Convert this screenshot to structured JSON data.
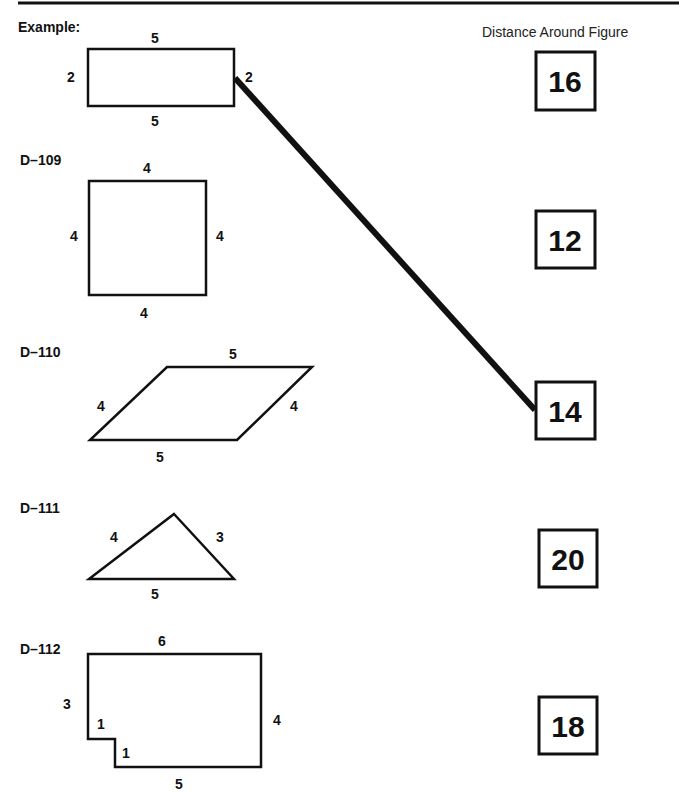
{
  "header": {
    "column_title": "Distance Around Figure"
  },
  "example": {
    "label": "Example:",
    "sides": {
      "top": "5",
      "bottom": "5",
      "left": "2",
      "right": "2"
    }
  },
  "problems": [
    {
      "id": "D–109",
      "shape": "square",
      "sides": {
        "top": "4",
        "bottom": "4",
        "left": "4",
        "right": "4"
      }
    },
    {
      "id": "D–110",
      "shape": "parallelogram",
      "sides": {
        "top": "5",
        "bottom": "5",
        "left": "4",
        "right": "4"
      }
    },
    {
      "id": "D–111",
      "shape": "triangle",
      "sides": {
        "left": "4",
        "right": "3",
        "bottom": "5"
      }
    },
    {
      "id": "D–112",
      "shape": "notched-rectangle",
      "sides": {
        "top": "6",
        "left": "3",
        "notch_top": "1",
        "notch_side": "1",
        "bottom": "5",
        "right": "4"
      }
    }
  ],
  "answers": [
    "16",
    "12",
    "14",
    "20",
    "18"
  ],
  "match_line": {
    "from": "example",
    "to_answer": "14"
  }
}
